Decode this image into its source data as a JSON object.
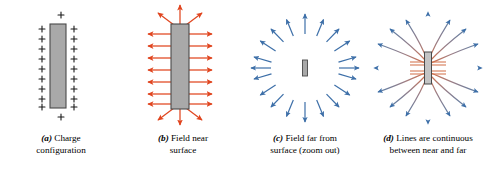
{
  "figure": {
    "background_color": "#ffffff",
    "width": 490,
    "height": 169
  },
  "colors": {
    "plate_fill": "#a9a9a9",
    "plate_fill_light": "#c4c4c4",
    "plate_stroke": "#4a4a4a",
    "charge_symbol": "#1a1a1a",
    "near_field_arrow": "#e0451f",
    "far_field_arrow": "#3d6fa8",
    "field_line_near": "#d4714b",
    "field_line_far": "#5a7fa8",
    "caption_text": "#000000"
  },
  "panels": [
    {
      "id": "a",
      "label": "(a)",
      "caption_line1": "Charge",
      "caption_line2": "configuration",
      "object": "charged-plate",
      "charge_symbol": "+",
      "charges_per_side": 9,
      "charges_top": 1,
      "charges_bottom": 1,
      "charge_sign": "positive"
    },
    {
      "id": "b",
      "label": "(b)",
      "caption_line1": "Field near",
      "caption_line2": "surface",
      "object": "charged-plate",
      "arrow_color_name": "red",
      "horizontal_arrows_per_side": 7,
      "end_arrows": 6,
      "field_direction": "outward-perpendicular"
    },
    {
      "id": "c",
      "label": "(c)",
      "caption_line1": "Field far from",
      "caption_line2": "surface (zoom out)",
      "object": "charged-plate-small",
      "arrow_color_name": "blue",
      "radial_arrows": 18,
      "field_direction": "outward-radial"
    },
    {
      "id": "d",
      "label": "(d)",
      "caption_line1": "Lines are continuous",
      "caption_line2": "between near and far",
      "object": "charged-plate",
      "field_lines": 18,
      "near_color_name": "red",
      "far_color_name": "blue",
      "field_direction": "outward-curving"
    }
  ]
}
